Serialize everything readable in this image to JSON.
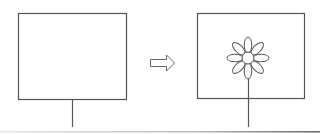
{
  "diagram": {
    "stroke_color": "#555555",
    "bottom_rule_color": "#666666",
    "left_panel": {
      "frame": {
        "x": 18,
        "y": 13,
        "w": 109,
        "h": 87
      },
      "stand": {
        "x": 72,
        "y1": 100,
        "y2": 127
      },
      "content": "empty"
    },
    "arrow": {
      "direction": "right",
      "x": 150,
      "y": 63,
      "length": 25
    },
    "right_panel": {
      "frame": {
        "x": 197,
        "y": 13,
        "w": 108,
        "h": 86
      },
      "stand": {
        "x": 248,
        "y1": 70,
        "y2": 127
      },
      "flower": {
        "cx": 248,
        "cy": 58,
        "center_radius": 6,
        "petal_count": 8,
        "petal_length": 10,
        "petal_width": 4
      }
    }
  }
}
